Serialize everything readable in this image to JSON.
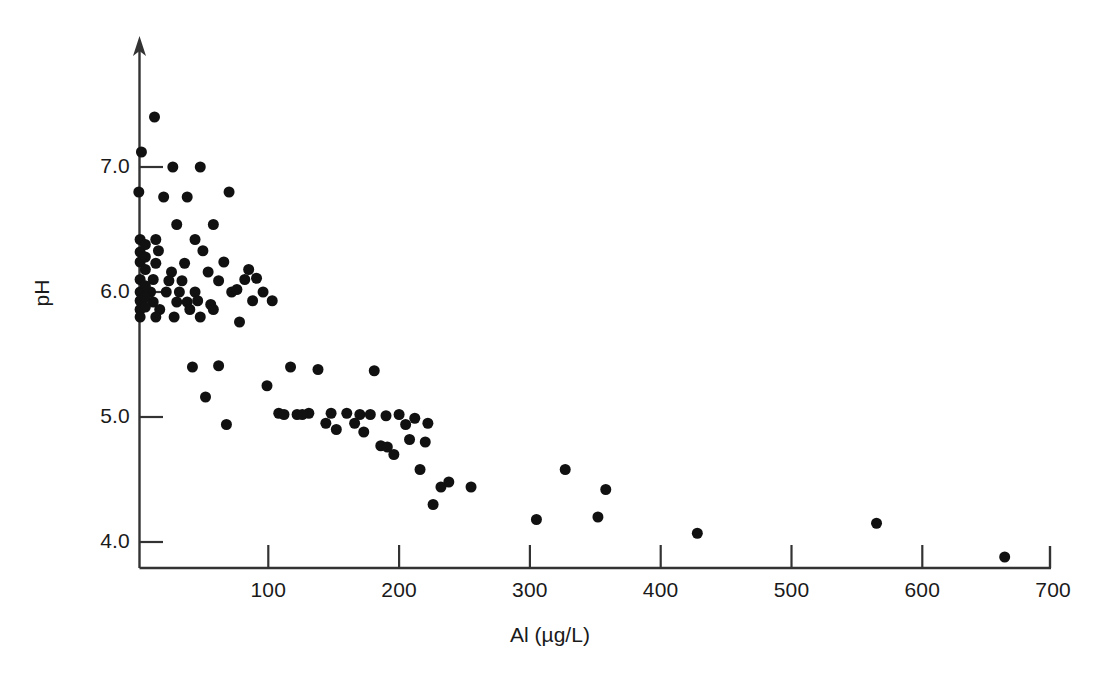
{
  "figure": {
    "background_color": "#ffffff",
    "marker_color": "#111111",
    "axis_color": "#333333"
  },
  "chart_data": {
    "type": "scatter",
    "title": "",
    "xlabel": "Al (µg/L)",
    "ylabel": "pH",
    "xlim": [
      0,
      700
    ],
    "ylim": [
      3.7,
      7.7
    ],
    "xticks": [
      100,
      200,
      300,
      400,
      500,
      600,
      700
    ],
    "xticklabels": [
      "100",
      "200",
      "300",
      "400",
      "500",
      "600",
      "700"
    ],
    "yticks": [
      4.0,
      5.0,
      6.0,
      7.0
    ],
    "yticklabels": [
      "4.0",
      "5.0",
      "6.0",
      "7.0"
    ],
    "grid": false,
    "legend": null,
    "marker": "filled-circle",
    "marker_size_px": 11,
    "n_points": 103,
    "points": [
      [
        13,
        7.4
      ],
      [
        3,
        7.12
      ],
      [
        27,
        7.0
      ],
      [
        48,
        7.0
      ],
      [
        1,
        6.8
      ],
      [
        20,
        6.76
      ],
      [
        38,
        6.76
      ],
      [
        70,
        6.8
      ],
      [
        30,
        6.54
      ],
      [
        58,
        6.54
      ],
      [
        2,
        6.42
      ],
      [
        14,
        6.42
      ],
      [
        44,
        6.42
      ],
      [
        2,
        6.32
      ],
      [
        16,
        6.33
      ],
      [
        50,
        6.33
      ],
      [
        2,
        6.24
      ],
      [
        14,
        6.23
      ],
      [
        36,
        6.23
      ],
      [
        66,
        6.24
      ],
      [
        26,
        6.16
      ],
      [
        54,
        6.16
      ],
      [
        85,
        6.18
      ],
      [
        2,
        6.1
      ],
      [
        12,
        6.1
      ],
      [
        34,
        6.09
      ],
      [
        62,
        6.09
      ],
      [
        91,
        6.11
      ],
      [
        2,
        6.0
      ],
      [
        10,
        6.0
      ],
      [
        22,
        6.0
      ],
      [
        44,
        6.0
      ],
      [
        72,
        6.0
      ],
      [
        96,
        6.0
      ],
      [
        2,
        5.93
      ],
      [
        12,
        5.92
      ],
      [
        30,
        5.92
      ],
      [
        38,
        5.92
      ],
      [
        56,
        5.9
      ],
      [
        103,
        5.93
      ],
      [
        2,
        5.86
      ],
      [
        17,
        5.86
      ],
      [
        40,
        5.86
      ],
      [
        2,
        5.8
      ],
      [
        14,
        5.8
      ],
      [
        28,
        5.8
      ],
      [
        48,
        5.8
      ],
      [
        78,
        5.76
      ],
      [
        62,
        5.41
      ],
      [
        99,
        5.25
      ],
      [
        52,
        5.16
      ],
      [
        68,
        4.94
      ],
      [
        108,
        5.03
      ],
      [
        122,
        5.02
      ],
      [
        117,
        5.4
      ],
      [
        138,
        5.38
      ],
      [
        131,
        5.03
      ],
      [
        144,
        4.95
      ],
      [
        152,
        4.9
      ],
      [
        160,
        5.03
      ],
      [
        170,
        5.02
      ],
      [
        178,
        5.02
      ],
      [
        181,
        5.37
      ],
      [
        190,
        5.01
      ],
      [
        173,
        4.88
      ],
      [
        186,
        4.77
      ],
      [
        191,
        4.76
      ],
      [
        196,
        4.7
      ],
      [
        205,
        4.94
      ],
      [
        212,
        4.99
      ],
      [
        208,
        4.82
      ],
      [
        220,
        4.8
      ],
      [
        216,
        4.58
      ],
      [
        226,
        4.3
      ],
      [
        238,
        4.48
      ],
      [
        255,
        4.44
      ],
      [
        305,
        4.18
      ],
      [
        327,
        4.58
      ],
      [
        352,
        4.2
      ],
      [
        358,
        4.42
      ],
      [
        428,
        4.07
      ],
      [
        565,
        4.15
      ],
      [
        663,
        3.88
      ],
      [
        6,
        6.38
      ],
      [
        6,
        6.28
      ],
      [
        6,
        6.18
      ],
      [
        6,
        6.05
      ],
      [
        6,
        5.96
      ],
      [
        6,
        5.88
      ],
      [
        24,
        6.09
      ],
      [
        32,
        6.0
      ],
      [
        46,
        5.93
      ],
      [
        58,
        5.86
      ],
      [
        76,
        6.02
      ],
      [
        82,
        6.1
      ],
      [
        88,
        5.93
      ],
      [
        112,
        5.02
      ],
      [
        126,
        5.02
      ],
      [
        148,
        5.03
      ],
      [
        166,
        4.95
      ],
      [
        200,
        5.02
      ],
      [
        222,
        4.95
      ],
      [
        232,
        4.44
      ],
      [
        42,
        5.4
      ]
    ]
  }
}
